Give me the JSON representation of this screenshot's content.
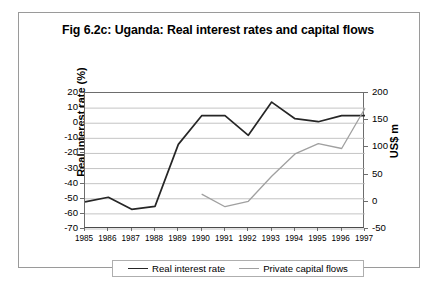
{
  "chart_data": {
    "type": "line",
    "title": "Fig 6.2c: Uganda: Real interest rates and capital flows",
    "xlabel": "",
    "ylabel": "Real interest rate (%)",
    "y2label": "US$ m",
    "grid": true,
    "legend_position": "bottom",
    "categories": [
      "1985",
      "1986",
      "1987",
      "1988",
      "1989",
      "1990",
      "1991",
      "1992",
      "1993",
      "1994",
      "1995",
      "1996",
      "1997"
    ],
    "ylim": [
      -70,
      20
    ],
    "yticks": [
      "20",
      "10",
      "0",
      "-10",
      "-20",
      "-30",
      "-40",
      "-50",
      "-60",
      "-70"
    ],
    "y2lim": [
      -50,
      200
    ],
    "y2ticks": [
      "200",
      "150",
      "100",
      "50",
      "0",
      "-50"
    ],
    "series": [
      {
        "name": "Real interest rate",
        "axis": "left",
        "color": "#262626",
        "values": [
          -52,
          -49,
          -57,
          -55,
          -14,
          5,
          5,
          -8,
          14,
          3,
          1,
          5,
          5
        ]
      },
      {
        "name": "Private capital flows",
        "axis": "right",
        "color": "#a0a0a0",
        "values": [
          null,
          null,
          null,
          null,
          null,
          14,
          -9,
          1,
          47,
          88,
          107,
          98,
          172
        ]
      }
    ]
  },
  "legend": {
    "entries": [
      {
        "label": "Real interest rate",
        "color": "#262626"
      },
      {
        "label": "Private capital flows",
        "color": "#a0a0a0"
      }
    ]
  }
}
